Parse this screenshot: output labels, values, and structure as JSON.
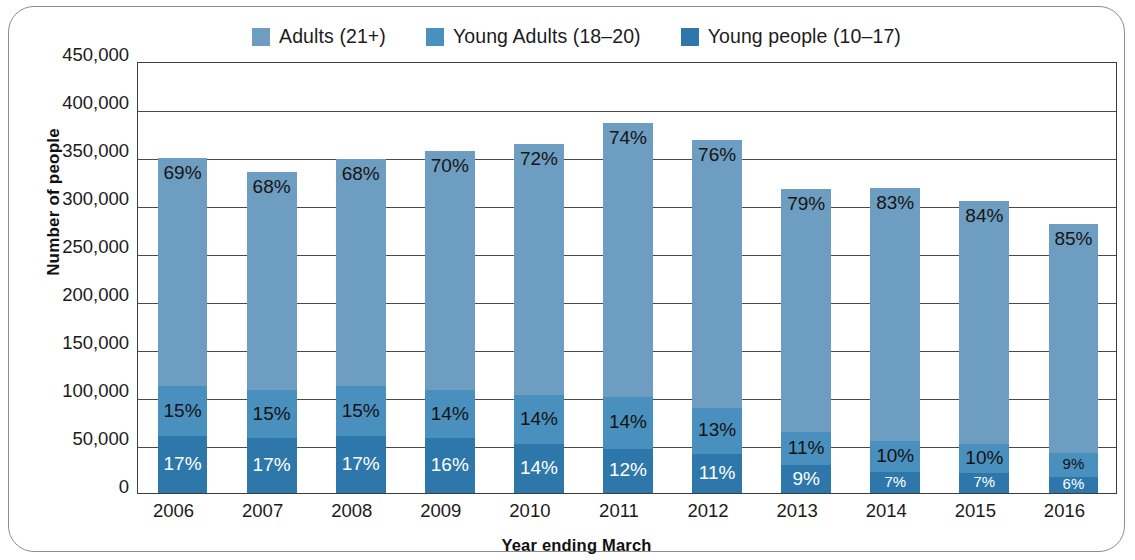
{
  "chart_data": {
    "type": "bar",
    "stacked": true,
    "title": "",
    "xlabel": "Year ending March",
    "ylabel": "Number of people",
    "categories": [
      "2006",
      "2007",
      "2008",
      "2009",
      "2010",
      "2011",
      "2012",
      "2013",
      "2014",
      "2015",
      "2016"
    ],
    "ylim": [
      0,
      450000
    ],
    "yticks": [
      0,
      50000,
      100000,
      150000,
      200000,
      250000,
      300000,
      350000,
      400000,
      450000
    ],
    "ytick_labels": [
      "0",
      "50,000",
      "100,000",
      "150,000",
      "200,000",
      "250,000",
      "300,000",
      "350,000",
      "400,000",
      "450,000"
    ],
    "grid": true,
    "legend_position": "top",
    "series": [
      {
        "name": "Adults (21+)",
        "color": "#6d9dc0",
        "values": [
          238000,
          227000,
          237000,
          249000,
          262000,
          285000,
          279000,
          253000,
          264000,
          253000,
          238000
        ],
        "labels": [
          "69%",
          "68%",
          "68%",
          "70%",
          "72%",
          "74%",
          "76%",
          "79%",
          "83%",
          "84%",
          "85%"
        ]
      },
      {
        "name": "Young Adults (18–20)",
        "color": "#4a90bf",
        "values": [
          52000,
          50000,
          52000,
          50000,
          51000,
          54000,
          48000,
          35000,
          32000,
          30000,
          25000
        ],
        "labels": [
          "15%",
          "15%",
          "15%",
          "14%",
          "14%",
          "14%",
          "13%",
          "11%",
          "10%",
          "10%",
          "9%"
        ]
      },
      {
        "name": "Young people (10–17)",
        "color": "#2e77aa",
        "values": [
          59000,
          57000,
          59000,
          57000,
          51000,
          46000,
          41000,
          29000,
          22000,
          21000,
          17000
        ],
        "labels": [
          "17%",
          "17%",
          "17%",
          "16%",
          "14%",
          "12%",
          "11%",
          "9%",
          "7%",
          "7%",
          "6%"
        ]
      }
    ],
    "totals": [
      349000,
      334000,
      348000,
      356000,
      364000,
      385000,
      368000,
      317000,
      318000,
      304000,
      280000
    ]
  },
  "legend": {
    "items": [
      {
        "label": "Adults (21+)",
        "color": "#6d9dc0"
      },
      {
        "label": "Young Adults (18–20)",
        "color": "#4a90bf"
      },
      {
        "label": "Young people (10–17)",
        "color": "#2e77aa"
      }
    ]
  },
  "axes": {
    "y_title": "Number of people",
    "x_title": "Year ending March"
  }
}
